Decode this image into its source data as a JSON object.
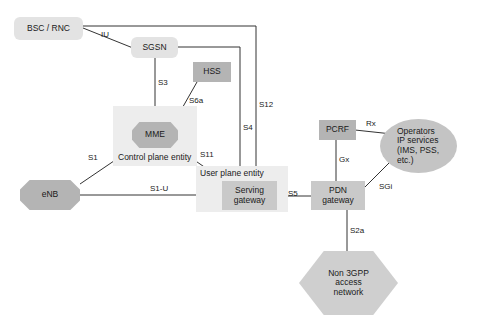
{
  "diagram": {
    "colors": {
      "node_light": "#e3e3e3",
      "node_mid": "#b4b4b4",
      "node_gateway": "#c9c9c9",
      "zone": "#ededed",
      "line": "#333333",
      "text": "#1a1a1a"
    },
    "nodes": [
      {
        "id": "bsc_rnc",
        "label": "BSC / RNC"
      },
      {
        "id": "sgsn",
        "label": "SGSN"
      },
      {
        "id": "hss",
        "label": "HSS"
      },
      {
        "id": "mme",
        "label": "MME"
      },
      {
        "id": "enb",
        "label": "eNB"
      },
      {
        "id": "sgw",
        "label": "Serving\ngateway"
      },
      {
        "id": "pgw",
        "label": "PDN\ngateway"
      },
      {
        "id": "pcrf",
        "label": "PCRF"
      },
      {
        "id": "operators",
        "label": "Operators\nIP services\n(IMS, PSS,\netc.)"
      },
      {
        "id": "non3gpp",
        "label": "Non 3GPP\naccess\nnetwork"
      }
    ],
    "zones": [
      {
        "id": "control_plane",
        "label": "Control plane entity"
      },
      {
        "id": "user_plane",
        "label": "User plane entity"
      }
    ],
    "interfaces": [
      {
        "id": "iu",
        "label": "IU"
      },
      {
        "id": "s3",
        "label": "S3"
      },
      {
        "id": "s6a",
        "label": "S6a"
      },
      {
        "id": "s12",
        "label": "S12"
      },
      {
        "id": "s4",
        "label": "S4"
      },
      {
        "id": "s1",
        "label": "S1"
      },
      {
        "id": "s11",
        "label": "S11"
      },
      {
        "id": "s1u",
        "label": "S1-U"
      },
      {
        "id": "s5",
        "label": "S5"
      },
      {
        "id": "rx",
        "label": "Rx"
      },
      {
        "id": "gx",
        "label": "Gx"
      },
      {
        "id": "sgi",
        "label": "SGi"
      },
      {
        "id": "s2a",
        "label": "S2a"
      }
    ]
  }
}
